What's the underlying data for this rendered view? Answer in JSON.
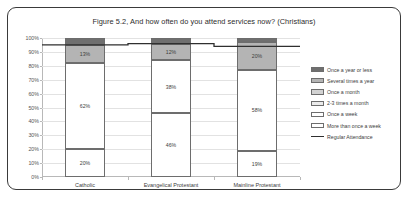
{
  "chart_data": {
    "type": "bar",
    "title": "Figure 5.2, And how often do you attend services now? (Christians)",
    "xlabel": "",
    "ylabel": "",
    "ylim": [
      0,
      100
    ],
    "grid": true,
    "stacked": true,
    "legend_position": "right",
    "categories": [
      "Catholic",
      "Evangelical Protestant",
      "Mainline Protestant"
    ],
    "ytick_labels": [
      "100%",
      "90%",
      "80%",
      "70%",
      "60%",
      "50%",
      "40%",
      "30%",
      "20%",
      "10%",
      "0%"
    ],
    "ytick_values": [
      100,
      90,
      80,
      70,
      60,
      50,
      40,
      30,
      20,
      10,
      0
    ],
    "series": [
      {
        "name": "More than once a week",
        "color": "#ffffff",
        "values": [
          20,
          46,
          19
        ],
        "labels": [
          "20%",
          "46%",
          "19%"
        ]
      },
      {
        "name": "Once a week",
        "color": "#ffffff",
        "values": [
          62,
          38,
          58
        ],
        "labels": [
          "62%",
          "38%",
          "58%"
        ]
      },
      {
        "name": "2-3 times a month",
        "color": "#ebebeb",
        "values": [
          0,
          0,
          0
        ],
        "labels": [
          "",
          "",
          ""
        ]
      },
      {
        "name": "Once a month",
        "color": "#d2d2d2",
        "values": [
          0,
          0,
          0
        ],
        "labels": [
          "",
          "",
          ""
        ]
      },
      {
        "name": "Several times a year",
        "color": "#b4b4b4",
        "values": [
          13,
          12,
          20
        ],
        "labels": [
          "13%",
          "12%",
          "20%"
        ]
      },
      {
        "name": "Once a year or less",
        "color": "#6f6f6f",
        "values": [
          5,
          4,
          3
        ],
        "labels": [
          "",
          "",
          ""
        ]
      }
    ],
    "line_series": {
      "name": "Regular Attendance",
      "color": "#2f2f2f",
      "values": [
        95,
        96,
        94
      ]
    },
    "legend_entries": [
      "Once a year or less",
      "Several times a year",
      "Once a month",
      "2-3 times a month",
      "Once a week",
      "More than once a week",
      "Regular Attendance"
    ]
  }
}
